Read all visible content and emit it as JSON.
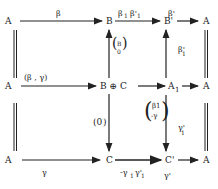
{
  "nodes": {
    "r1c1": "A",
    "r1c2": "B",
    "r1c3": "B'",
    "r1c4": "A",
    "r2c1": "A",
    "r2c2": "B ⊕ C",
    "r2c3": "A",
    "r2c3_sub": "1",
    "r2c4": "A",
    "r3c1": "A",
    "r3c2": "C",
    "r3c3": "C'",
    "r3c4": "A"
  },
  "labels": {
    "top_1": "β",
    "top_2": "β",
    "top_2_sub": "1",
    "top_2b": "β'",
    "top_2b_sub": "1",
    "top_3": "β'",
    "mid_1": "(β , γ)",
    "up_B": "B",
    "up_C": "0",
    "down_BC_C": "(0 1)",
    "up_A1_B": "β'",
    "up_A1_B_sub": "1",
    "diag_a": "β1",
    "diag_b": "-γ",
    "down_A1_C": "γ'",
    "down_A1_C_sub": "1",
    "bot_1": "γ",
    "bot_2": "-γ",
    "bot_2_sub": "1",
    "bot_2b": "γ'",
    "bot_2b_sub": "1",
    "bot_3": "γ'"
  },
  "colors": {
    "ink": "#222222",
    "background": "#ffffff"
  }
}
